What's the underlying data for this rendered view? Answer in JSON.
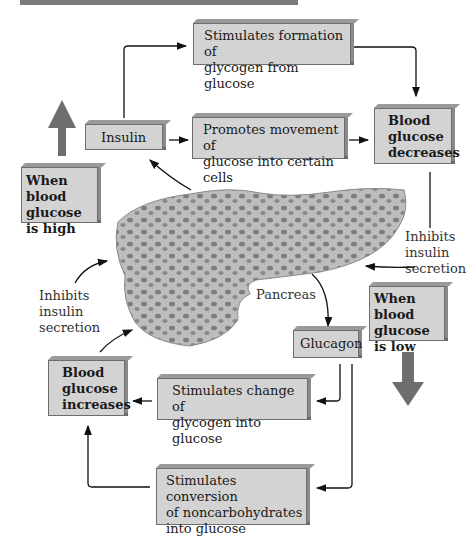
{
  "diagram": {
    "title_bar": "",
    "boxes": {
      "stim_glycogen_formation": [
        "Stimulates formation of",
        "glycogen from glucose"
      ],
      "insulin": "Insulin",
      "promotes_movement": [
        "Promotes movement of",
        "glucose into certain cells"
      ],
      "glucose_decreases": [
        "Blood",
        "glucose",
        "decreases"
      ],
      "when_high": [
        "When blood",
        "glucose",
        "is high"
      ],
      "when_low": [
        "When blood",
        "glucose",
        "is low"
      ],
      "glucagon": "Glucagon",
      "glucose_increases": [
        "Blood",
        "glucose",
        "increases"
      ],
      "stim_glycogen_change": [
        "Stimulates change of",
        "glycogen into glucose"
      ],
      "stim_conversion": [
        "Stimulates conversion",
        "of noncarbohydrates",
        "into glucose"
      ]
    },
    "labels": {
      "inhibits_right": [
        "Inhibits",
        "insulin",
        "secretion"
      ],
      "inhibits_left": [
        "Inhibits",
        "insulin",
        "secretion"
      ],
      "pancreas": "Pancreas"
    },
    "colors": {
      "box_fill": "#d3d3d3",
      "box_border": "#6d6d6d",
      "big_arrow": "#6e6e6e",
      "pancreas_fill": "#b4b4b4",
      "islet": "#7d7d7d"
    }
  }
}
